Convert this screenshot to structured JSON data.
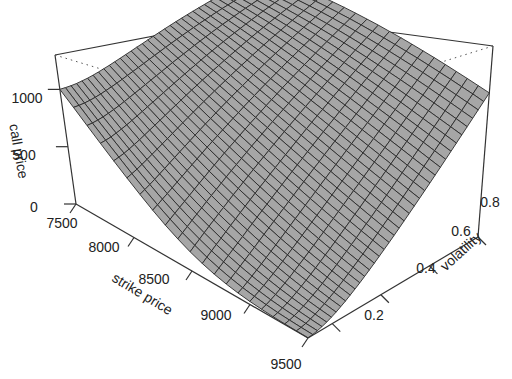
{
  "chart_data": {
    "type": "surface3d",
    "title": "",
    "x": {
      "label": "strike price",
      "ticks": [
        7500,
        8000,
        8500,
        9000,
        9500
      ],
      "range": [
        7500,
        9500
      ]
    },
    "y": {
      "label": "volatility",
      "ticks": [
        0.2,
        0.4,
        0.6,
        0.8
      ],
      "range": [
        0.1,
        0.8
      ]
    },
    "z": {
      "label": "call price",
      "ticks": [
        0,
        500,
        1000
      ],
      "range": [
        0,
        1300
      ]
    },
    "grid_x_count": 20,
    "grid_y_count": 36,
    "corner_values": {
      "strike_7500_vol_low": 1000,
      "strike_7500_vol_0.8": 1300,
      "strike_9500_vol_low": 0,
      "strike_9500_vol_0.8": 650
    },
    "model": {
      "spot": 8500,
      "rate": 0.0,
      "maturity": 0.25,
      "vol_min": 0.1,
      "vol_max": 0.8
    },
    "surface_fill": "#a6a6a6",
    "mesh_color": "#2a2a2a",
    "box_color": "#333333"
  },
  "labels": {
    "z_title": "call price",
    "x_title": "strike price",
    "y_title": "volatility",
    "z_ticks": [
      "0",
      "500",
      "1000"
    ],
    "x_ticks": [
      "7500",
      "8000",
      "8500",
      "9000",
      "9500"
    ],
    "y_ticks": [
      "0.2",
      "0.4",
      "0.6",
      "0.8"
    ]
  }
}
